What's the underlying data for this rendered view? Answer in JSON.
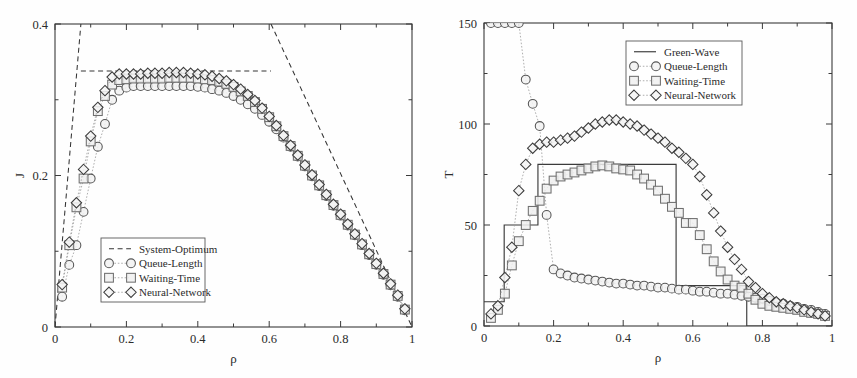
{
  "figure": {
    "background": "#fefefe",
    "panels": [
      "left",
      "right"
    ]
  },
  "chart_data": [
    {
      "id": "left",
      "type": "scatter",
      "title": "",
      "xlabel": "ρ",
      "ylabel": "J",
      "xlim": [
        0,
        1
      ],
      "ylim": [
        0,
        0.4
      ],
      "xticks": [
        0,
        0.2,
        0.4,
        0.6,
        0.8,
        1
      ],
      "xticklabels": [
        "0",
        "0.2",
        "0.4",
        "0.6",
        "0.8",
        "1"
      ],
      "yticks": [
        0,
        0.2,
        0.4
      ],
      "yticklabels": [
        "0",
        "0.2",
        "0.4"
      ],
      "xminorticks": [
        0.1,
        0.3,
        0.5,
        0.7,
        0.9
      ],
      "yminorticks": [
        0.1,
        0.3
      ],
      "grid": false,
      "legend_position": "lower-left",
      "legend": [
        {
          "label": "System-Optimum",
          "marker": "dashed-line"
        },
        {
          "label": "Queue-Length",
          "marker": "circle"
        },
        {
          "label": "Waiting-Time",
          "marker": "square"
        },
        {
          "label": "Neural-Network",
          "marker": "diamond"
        }
      ],
      "series": [
        {
          "name": "System-Optimum",
          "marker": "none",
          "line": "dashed",
          "x": [
            0.0,
            0.0725,
            0.0725,
            0.605,
            0.605,
            1.0
          ],
          "values": [
            0.0,
            0.4,
            0.338,
            0.338,
            0.4,
            0.0
          ],
          "note": "piecewise: steep rise, plateau 0.338, steep fall; drawn as three dashed segments"
        },
        {
          "name": "Queue-Length",
          "marker": "circle",
          "line": "dotted",
          "x": [
            0.02,
            0.04,
            0.06,
            0.08,
            0.1,
            0.12,
            0.14,
            0.16,
            0.18,
            0.2,
            0.22,
            0.24,
            0.26,
            0.28,
            0.3,
            0.32,
            0.34,
            0.36,
            0.38,
            0.4,
            0.42,
            0.44,
            0.46,
            0.48,
            0.5,
            0.52,
            0.54,
            0.56,
            0.58,
            0.6,
            0.62,
            0.64,
            0.66,
            0.68,
            0.7,
            0.72,
            0.74,
            0.76,
            0.78,
            0.8,
            0.82,
            0.84,
            0.86,
            0.88,
            0.9,
            0.92,
            0.94,
            0.96,
            0.98
          ],
          "values": [
            0.04,
            0.082,
            0.108,
            0.152,
            0.196,
            0.238,
            0.268,
            0.3,
            0.312,
            0.316,
            0.318,
            0.318,
            0.318,
            0.318,
            0.318,
            0.318,
            0.318,
            0.318,
            0.318,
            0.317,
            0.316,
            0.314,
            0.312,
            0.309,
            0.305,
            0.3,
            0.294,
            0.288,
            0.28,
            0.271,
            0.261,
            0.25,
            0.238,
            0.225,
            0.212,
            0.199,
            0.186,
            0.173,
            0.16,
            0.147,
            0.134,
            0.121,
            0.108,
            0.095,
            0.082,
            0.069,
            0.055,
            0.04,
            0.022
          ]
        },
        {
          "name": "Waiting-Time",
          "marker": "square",
          "line": "dotted",
          "x": [
            0.02,
            0.04,
            0.06,
            0.08,
            0.1,
            0.12,
            0.14,
            0.16,
            0.18,
            0.2,
            0.22,
            0.24,
            0.26,
            0.28,
            0.3,
            0.32,
            0.34,
            0.36,
            0.38,
            0.4,
            0.42,
            0.44,
            0.46,
            0.48,
            0.5,
            0.52,
            0.54,
            0.56,
            0.58,
            0.6,
            0.62,
            0.64,
            0.66,
            0.68,
            0.7,
            0.72,
            0.74,
            0.76,
            0.78,
            0.8,
            0.82,
            0.84,
            0.86,
            0.88,
            0.9,
            0.92,
            0.94,
            0.96,
            0.98
          ],
          "values": [
            0.052,
            0.108,
            0.158,
            0.196,
            0.245,
            0.285,
            0.305,
            0.32,
            0.326,
            0.327,
            0.328,
            0.328,
            0.328,
            0.328,
            0.328,
            0.329,
            0.329,
            0.329,
            0.329,
            0.328,
            0.327,
            0.326,
            0.324,
            0.321,
            0.317,
            0.311,
            0.305,
            0.297,
            0.288,
            0.277,
            0.265,
            0.252,
            0.239,
            0.226,
            0.213,
            0.2,
            0.187,
            0.174,
            0.161,
            0.148,
            0.135,
            0.122,
            0.109,
            0.096,
            0.083,
            0.07,
            0.056,
            0.041,
            0.023
          ]
        },
        {
          "name": "Neural-Network",
          "marker": "diamond",
          "line": "dotted",
          "x": [
            0.02,
            0.04,
            0.06,
            0.08,
            0.1,
            0.12,
            0.14,
            0.16,
            0.18,
            0.2,
            0.22,
            0.24,
            0.26,
            0.28,
            0.3,
            0.32,
            0.34,
            0.36,
            0.38,
            0.4,
            0.42,
            0.44,
            0.46,
            0.48,
            0.5,
            0.52,
            0.54,
            0.56,
            0.58,
            0.6,
            0.62,
            0.64,
            0.66,
            0.68,
            0.7,
            0.72,
            0.74,
            0.76,
            0.78,
            0.8,
            0.82,
            0.84,
            0.86,
            0.88,
            0.9,
            0.92,
            0.94,
            0.96,
            0.98
          ],
          "values": [
            0.056,
            0.112,
            0.164,
            0.208,
            0.252,
            0.29,
            0.312,
            0.33,
            0.334,
            0.334,
            0.334,
            0.334,
            0.335,
            0.335,
            0.335,
            0.336,
            0.336,
            0.336,
            0.335,
            0.334,
            0.333,
            0.331,
            0.328,
            0.325,
            0.32,
            0.314,
            0.307,
            0.299,
            0.289,
            0.278,
            0.266,
            0.253,
            0.24,
            0.227,
            0.214,
            0.201,
            0.188,
            0.175,
            0.162,
            0.149,
            0.136,
            0.123,
            0.11,
            0.097,
            0.084,
            0.071,
            0.057,
            0.042,
            0.024
          ]
        }
      ]
    },
    {
      "id": "right",
      "type": "scatter",
      "title": "",
      "xlabel": "ρ",
      "ylabel": "T",
      "xlim": [
        0,
        1
      ],
      "ylim": [
        0,
        150
      ],
      "xticks": [
        0,
        0.2,
        0.4,
        0.6,
        0.8,
        1
      ],
      "xticklabels": [
        "0",
        "0.2",
        "0.4",
        "0.6",
        "0.8",
        "1"
      ],
      "yticks": [
        0,
        50,
        100,
        150
      ],
      "yticklabels": [
        "0",
        "50",
        "100",
        "150"
      ],
      "xminorticks": [
        0.1,
        0.3,
        0.5,
        0.7,
        0.9
      ],
      "yminorticks": [
        25,
        75,
        125
      ],
      "grid": false,
      "legend_position": "upper-right",
      "legend": [
        {
          "label": "Green-Wave",
          "marker": "solid-line"
        },
        {
          "label": "Queue-Length",
          "marker": "circle"
        },
        {
          "label": "Waiting-Time",
          "marker": "square"
        },
        {
          "label": "Neural-Network",
          "marker": "diamond"
        }
      ],
      "series": [
        {
          "name": "Green-Wave",
          "marker": "none",
          "line": "solid",
          "x": [
            0.0,
            0.058,
            0.058,
            0.155,
            0.155,
            0.552,
            0.552,
            0.755,
            0.755,
            1.0
          ],
          "values": [
            12,
            12,
            50,
            50,
            80,
            80,
            20,
            20,
            0,
            0
          ],
          "note": "step function"
        },
        {
          "name": "Queue-Length",
          "marker": "circle",
          "line": "dotted",
          "x": [
            0.02,
            0.04,
            0.06,
            0.08,
            0.1,
            0.12,
            0.14,
            0.16,
            0.18,
            0.2,
            0.22,
            0.24,
            0.26,
            0.28,
            0.3,
            0.32,
            0.34,
            0.36,
            0.38,
            0.4,
            0.42,
            0.44,
            0.46,
            0.48,
            0.5,
            0.52,
            0.54,
            0.56,
            0.58,
            0.6,
            0.62,
            0.64,
            0.66,
            0.68,
            0.7,
            0.72,
            0.74,
            0.76,
            0.78,
            0.8,
            0.82,
            0.84,
            0.86,
            0.88,
            0.9,
            0.92,
            0.94,
            0.96,
            0.98
          ],
          "values": [
            150,
            150,
            150,
            150,
            150,
            122,
            110,
            99,
            55,
            28,
            26,
            25,
            24,
            23.5,
            23,
            22.5,
            22,
            21.5,
            21,
            21,
            20.5,
            20,
            20,
            19.5,
            19,
            19,
            18.5,
            18,
            18,
            17.5,
            17,
            17,
            16.5,
            16,
            16,
            15.5,
            15,
            14.5,
            14,
            13.5,
            12.5,
            11.5,
            11,
            10,
            9.5,
            8.5,
            8,
            7,
            6
          ]
        },
        {
          "name": "Waiting-Time",
          "marker": "square",
          "line": "dotted",
          "x": [
            0.02,
            0.04,
            0.06,
            0.08,
            0.1,
            0.12,
            0.14,
            0.16,
            0.18,
            0.2,
            0.22,
            0.24,
            0.26,
            0.28,
            0.3,
            0.32,
            0.34,
            0.36,
            0.38,
            0.4,
            0.42,
            0.44,
            0.46,
            0.48,
            0.5,
            0.52,
            0.54,
            0.56,
            0.58,
            0.6,
            0.62,
            0.64,
            0.66,
            0.68,
            0.7,
            0.72,
            0.74,
            0.76,
            0.78,
            0.8,
            0.82,
            0.84,
            0.86,
            0.88,
            0.9,
            0.92,
            0.94,
            0.96,
            0.98
          ],
          "values": [
            4,
            8,
            16,
            30,
            42,
            50,
            57,
            62,
            68,
            72,
            74,
            75,
            76,
            77,
            78,
            79,
            79.5,
            79,
            78,
            77.5,
            77,
            75,
            73,
            70,
            67,
            63,
            59,
            56,
            51,
            51,
            45,
            38,
            32,
            27,
            23,
            20,
            19,
            16,
            13,
            11,
            10,
            9.5,
            9,
            8.5,
            8,
            7,
            6.5,
            6,
            5
          ]
        },
        {
          "name": "Neural-Network",
          "marker": "diamond",
          "line": "dotted",
          "x": [
            0.02,
            0.04,
            0.06,
            0.08,
            0.1,
            0.12,
            0.14,
            0.16,
            0.18,
            0.2,
            0.22,
            0.24,
            0.26,
            0.28,
            0.3,
            0.32,
            0.34,
            0.36,
            0.38,
            0.4,
            0.42,
            0.44,
            0.46,
            0.48,
            0.5,
            0.52,
            0.54,
            0.56,
            0.58,
            0.6,
            0.62,
            0.64,
            0.66,
            0.68,
            0.7,
            0.72,
            0.74,
            0.76,
            0.78,
            0.8,
            0.82,
            0.84,
            0.86,
            0.88,
            0.9,
            0.92,
            0.94,
            0.96,
            0.98
          ],
          "values": [
            6,
            10,
            24,
            39,
            67,
            80,
            88,
            90,
            91,
            91,
            92,
            93,
            94,
            96,
            98,
            100,
            101,
            102,
            102,
            101,
            100,
            99,
            97,
            95,
            93,
            91,
            88,
            86,
            83,
            80,
            74,
            65,
            56,
            47,
            39,
            33,
            28,
            22,
            19,
            16,
            14,
            12,
            11,
            10,
            9,
            8,
            7,
            6,
            5
          ]
        }
      ]
    }
  ]
}
